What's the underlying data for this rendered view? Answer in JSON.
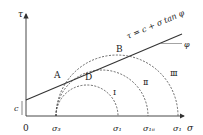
{
  "diagram": {
    "axis_labels": {
      "tau": "τ",
      "sigma": "σ",
      "origin": "0"
    },
    "cohesion_label": "c",
    "envelope_label": "τ = c + σ tan φ",
    "angle_label": "φ",
    "point_labels": {
      "A": "A",
      "B": "B",
      "D": "D"
    },
    "circle_labels": [
      "Ⅰ",
      "Ⅱ",
      "Ⅲ"
    ],
    "tick_labels": {
      "sigma3": "σ₃",
      "sigma1_I": "σ₁",
      "sigma1_II": "σ₁ᵢᵢ",
      "sigma1_III": "σ₁"
    },
    "colors": {
      "line": "#333333",
      "dash": "#444444"
    }
  }
}
